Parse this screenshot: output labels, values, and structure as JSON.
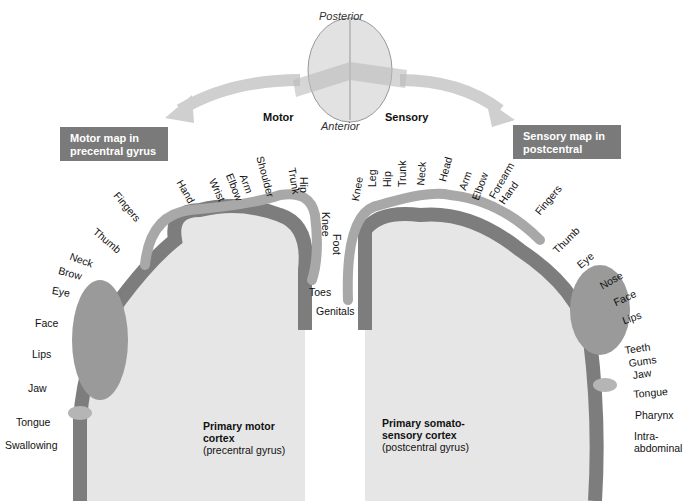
{
  "top": {
    "posterior": "Posterior",
    "anterior": "Anterior",
    "motor": "Motor",
    "sensory": "Sensory"
  },
  "boxes": {
    "motor_map": [
      "Motor map in",
      "precentral gyrus"
    ],
    "sensory_map": [
      "Sensory map in",
      "postcentral gyrus"
    ]
  },
  "motor": {
    "cortex_title": [
      "Primary motor",
      "cortex"
    ],
    "cortex_sub": "(precentral gyrus)",
    "labels": [
      "Toes",
      "Foot",
      "Knee",
      "Hip",
      "Trunk",
      "Shoulder",
      "Arm",
      "Elbow",
      "Wrist",
      "Hand",
      "Fingers",
      "Thumb",
      "Neck",
      "Brow",
      "Eye",
      "Face",
      "Lips",
      "Jaw",
      "Tongue",
      "Swallowing"
    ]
  },
  "sensory": {
    "cortex_title": [
      "Primary somato-",
      "sensory cortex"
    ],
    "cortex_sub": "(postcentral gyrus)",
    "labels": [
      "Genitals",
      "Knee",
      "Leg",
      "Hip",
      "Trunk",
      "Neck",
      "Head",
      "Arm",
      "Elbow",
      "Forearm",
      "Hand",
      "Fingers",
      "Thumb",
      "Eye",
      "Nose",
      "Face",
      "Lips",
      "Teeth",
      "Gums",
      "Jaw",
      "Tongue",
      "Pharynx",
      "Intra-",
      "abdominal"
    ]
  },
  "colors": {
    "box_bg": "#7a7a7a",
    "cortex_gray": "#7d7d7d",
    "white_matter": "#e6e6e6",
    "homunculus": "#a8a8a8",
    "arrow": "#c9c9c9"
  }
}
